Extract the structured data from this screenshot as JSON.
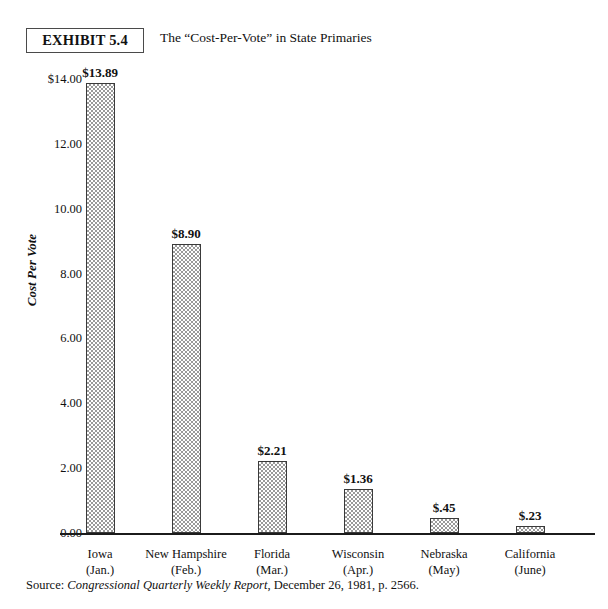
{
  "header": {
    "exhibit_badge": "EXHIBIT 5.4",
    "title": "The “Cost-Per-Vote” in State Primaries"
  },
  "source": {
    "prefix": "Source: ",
    "publication": "Congressional Quarterly Weekly Report",
    "suffix": ", December 26, 1981, p. 2566."
  },
  "chart_data": {
    "type": "bar",
    "title": "The “Cost-Per-Vote” in State Primaries",
    "xlabel": "",
    "ylabel": "Cost Per Vote",
    "ylim": [
      0,
      14
    ],
    "grid": false,
    "legend": "none",
    "categories": [
      "Iowa",
      "New Hampshire",
      "Florida",
      "Wisconsin",
      "Nebraska",
      "California"
    ],
    "category_sublabels": [
      "(Jan.)",
      "(Feb.)",
      "(Mar.)",
      "(Apr.)",
      "(May)",
      "(June)"
    ],
    "values": [
      13.89,
      8.9,
      2.21,
      1.36,
      0.45,
      0.23
    ],
    "data_labels": [
      "$13.89",
      "$8.90",
      "$2.21",
      "$1.36",
      "$.45",
      "$.23"
    ],
    "ytick_values": [
      14.0,
      12.0,
      10.0,
      8.0,
      6.0,
      4.0,
      2.0,
      0.0
    ],
    "ytick_labels": [
      "$14.00",
      "12.00",
      "10.00",
      "8.00",
      "6.00",
      "4.00",
      "2.00",
      "0.00"
    ]
  },
  "colors": {
    "bar_fill": "#9a9a9a",
    "bar_border": "#3a3a3a",
    "axis": "#1b1b1b",
    "text": "#111111",
    "background": "#ffffff"
  }
}
